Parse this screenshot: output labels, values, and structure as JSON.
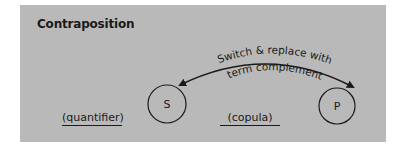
{
  "diagram": {
    "title": "Contraposition",
    "arrow_label": [
      "Switch & replace with",
      "term complement"
    ],
    "subject_term": "S",
    "predicate_term": "P",
    "quantifier_label": "(quantifier)",
    "copula_label": "(copula)",
    "colors": {
      "panel_background": "#b9b9b9",
      "ink": "#1a1a1a",
      "page_background": "#ffffff"
    }
  }
}
